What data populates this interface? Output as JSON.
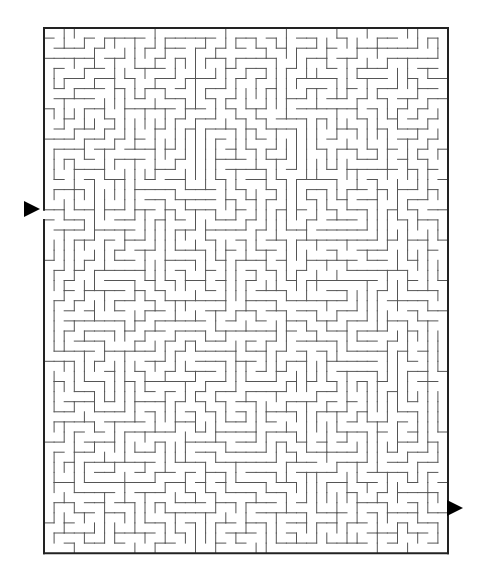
{
  "maze": {
    "cols": 40,
    "rows": 52,
    "left": 44,
    "top": 28,
    "cell_w": 10.1,
    "cell_h": 10.1,
    "seed": 7,
    "entrance": {
      "side": "left",
      "row": 18
    },
    "exit": {
      "side": "right",
      "row": 47
    },
    "wall_color": "#555555",
    "border_color": "#222222"
  },
  "markers": {
    "start_arrow": {
      "x": 24,
      "y": 201
    },
    "end_arrow": {
      "x": 447,
      "y": 500
    }
  }
}
